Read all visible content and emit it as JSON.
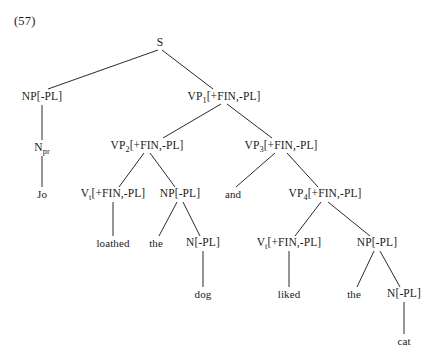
{
  "figure": {
    "example_number": "(57)",
    "kind": "syntax-tree",
    "sentence": "Jo loathed the dog and liked the cat"
  },
  "tree": {
    "nodes": [
      {
        "id": "S",
        "base": "S",
        "sub": "",
        "features": "",
        "x": 160,
        "y": 43,
        "label": "S"
      },
      {
        "id": "NP1",
        "base": "NP",
        "sub": "",
        "features": "[-PL]",
        "x": 42,
        "y": 97,
        "label": "NP[-PL]"
      },
      {
        "id": "VP1",
        "base": "VP",
        "sub": "1",
        "features": "[+FIN,-PL]",
        "x": 224,
        "y": 97,
        "label": "VP1[+FIN,-PL]"
      },
      {
        "id": "Npr",
        "base": "N",
        "sub": "pr",
        "features": "",
        "x": 42,
        "y": 148,
        "label": "Npr"
      },
      {
        "id": "VP2",
        "base": "VP",
        "sub": "2",
        "features": "[+FIN,-PL]",
        "x": 147,
        "y": 146,
        "label": "VP2[+FIN,-PL]"
      },
      {
        "id": "VP3",
        "base": "VP",
        "sub": "3",
        "features": "[+FIN,-PL]",
        "x": 281,
        "y": 146,
        "label": "VP3[+FIN,-PL]"
      },
      {
        "id": "Vt1",
        "base": "V",
        "sub": "t",
        "features": "[+FIN,-PL]",
        "x": 113,
        "y": 194,
        "label": "Vt[+FIN,-PL]"
      },
      {
        "id": "NP2",
        "base": "NP",
        "sub": "",
        "features": "[-PL]",
        "x": 180,
        "y": 194,
        "label": "NP[-PL]"
      },
      {
        "id": "VP4",
        "base": "VP",
        "sub": "4",
        "features": "[+FIN,-PL]",
        "x": 325,
        "y": 194,
        "label": "VP4[+FIN,-PL]"
      },
      {
        "id": "N1",
        "base": "N",
        "sub": "",
        "features": "[-PL]",
        "x": 203,
        "y": 243,
        "label": "N[-PL]"
      },
      {
        "id": "Vt2",
        "base": "V",
        "sub": "t",
        "features": "[+FIN,-PL]",
        "x": 289,
        "y": 243,
        "label": "Vt[+FIN,-PL]"
      },
      {
        "id": "NP3",
        "base": "NP",
        "sub": "",
        "features": "[-PL]",
        "x": 377,
        "y": 243,
        "label": "NP[-PL]"
      },
      {
        "id": "N2",
        "base": "N",
        "sub": "",
        "features": "[-PL]",
        "x": 404,
        "y": 294,
        "label": "N[-PL]"
      }
    ],
    "leaves": [
      {
        "id": "jo",
        "text": "Jo",
        "x": 42,
        "y": 194
      },
      {
        "id": "loathed",
        "text": "loathed",
        "x": 113,
        "y": 243
      },
      {
        "id": "the1",
        "text": "the",
        "x": 156,
        "y": 243
      },
      {
        "id": "and",
        "text": "and",
        "x": 233,
        "y": 194
      },
      {
        "id": "dog",
        "text": "dog",
        "x": 203,
        "y": 294
      },
      {
        "id": "liked",
        "text": "liked",
        "x": 289,
        "y": 294
      },
      {
        "id": "the2",
        "text": "the",
        "x": 354,
        "y": 294
      },
      {
        "id": "cat",
        "text": "cat",
        "x": 404,
        "y": 341
      }
    ],
    "edges": [
      {
        "from": "S",
        "to": "NP1",
        "x1": 158,
        "y1": 50,
        "x2": 48,
        "y2": 89
      },
      {
        "from": "S",
        "to": "VP1",
        "x1": 162,
        "y1": 50,
        "x2": 213,
        "y2": 89
      },
      {
        "from": "NP1",
        "to": "Npr",
        "x1": 42,
        "y1": 105,
        "x2": 42,
        "y2": 140
      },
      {
        "from": "Npr",
        "to": "jo",
        "x1": 42,
        "y1": 156,
        "x2": 42,
        "y2": 187
      },
      {
        "from": "VP1",
        "to": "VP2",
        "x1": 221,
        "y1": 104,
        "x2": 163,
        "y2": 138
      },
      {
        "from": "VP1",
        "to": "VP3",
        "x1": 227,
        "y1": 104,
        "x2": 272,
        "y2": 138
      },
      {
        "from": "VP2",
        "to": "Vt1",
        "x1": 144,
        "y1": 153,
        "x2": 119,
        "y2": 187
      },
      {
        "from": "VP2",
        "to": "NP2",
        "x1": 150,
        "y1": 153,
        "x2": 175,
        "y2": 187
      },
      {
        "from": "VP3",
        "to": "and",
        "x1": 275,
        "y1": 153,
        "x2": 236,
        "y2": 187
      },
      {
        "from": "VP3",
        "to": "VP4",
        "x1": 287,
        "y1": 153,
        "x2": 318,
        "y2": 187
      },
      {
        "from": "Vt1",
        "to": "loathed",
        "x1": 113,
        "y1": 202,
        "x2": 113,
        "y2": 236
      },
      {
        "from": "NP2",
        "to": "the1",
        "x1": 177,
        "y1": 202,
        "x2": 159,
        "y2": 236
      },
      {
        "from": "NP2",
        "to": "N1",
        "x1": 183,
        "y1": 202,
        "x2": 200,
        "y2": 236
      },
      {
        "from": "VP4",
        "to": "Vt2",
        "x1": 321,
        "y1": 202,
        "x2": 295,
        "y2": 236
      },
      {
        "from": "VP4",
        "to": "NP3",
        "x1": 328,
        "y1": 202,
        "x2": 370,
        "y2": 236
      },
      {
        "from": "N1",
        "to": "dog",
        "x1": 203,
        "y1": 251,
        "x2": 203,
        "y2": 287
      },
      {
        "from": "Vt2",
        "to": "liked",
        "x1": 289,
        "y1": 251,
        "x2": 289,
        "y2": 287
      },
      {
        "from": "NP3",
        "to": "the2",
        "x1": 374,
        "y1": 251,
        "x2": 357,
        "y2": 287
      },
      {
        "from": "NP3",
        "to": "N2",
        "x1": 380,
        "y1": 251,
        "x2": 400,
        "y2": 287
      },
      {
        "from": "N2",
        "to": "cat",
        "x1": 404,
        "y1": 302,
        "x2": 404,
        "y2": 334
      }
    ]
  },
  "style": {
    "line_color": "#2b2b2b",
    "text_color": "#1a1a1a",
    "background": "#ffffff"
  }
}
